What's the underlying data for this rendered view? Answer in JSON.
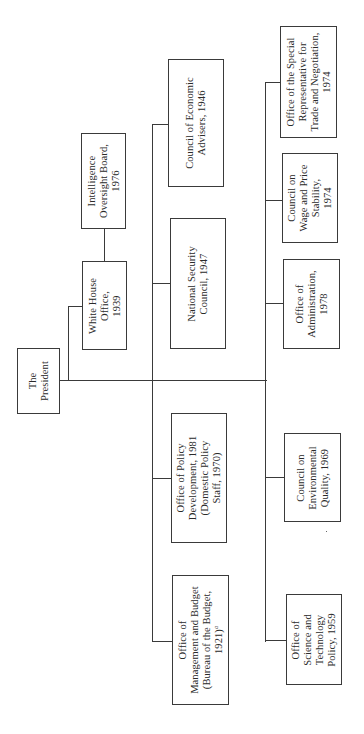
{
  "chart": {
    "root": {
      "id": "president",
      "lines": [
        "The",
        "President"
      ]
    },
    "offices": [
      {
        "id": "white-house-office",
        "lines": [
          "White House",
          "Office,",
          "1939"
        ]
      },
      {
        "id": "intelligence-oversight-board",
        "lines": [
          "Intelligence",
          "Oversight Board,",
          "1976"
        ]
      },
      {
        "id": "council-of-economic-advisers",
        "lines": [
          "Council of Economic",
          "Advisers, 1946"
        ]
      },
      {
        "id": "national-security-council",
        "lines": [
          "National Security",
          "Council, 1947"
        ]
      },
      {
        "id": "office-of-policy-development",
        "lines": [
          "Office of Policy",
          "Development, 1981",
          "(Domestic Policy",
          "Staff, 1970)"
        ]
      },
      {
        "id": "office-of-management-and-budget",
        "lines": [
          "Office of",
          "Management and Budget",
          "(Bureau of the Budget,",
          "1921)"
        ],
        "footnote": "a"
      },
      {
        "id": "office-of-special-representative",
        "lines": [
          "Office of the Special",
          "Representative for",
          "Trade and Negotiation,",
          "1974"
        ]
      },
      {
        "id": "council-on-wage-and-price-stability",
        "lines": [
          "Council on",
          "Wage and Price",
          "Stability,",
          "1974"
        ]
      },
      {
        "id": "office-of-administration",
        "lines": [
          "Office of",
          "Administration,",
          "1978"
        ]
      },
      {
        "id": "council-on-environmental-quality",
        "lines": [
          "Council on",
          "Environmental",
          "Quality, 1969"
        ]
      },
      {
        "id": "office-of-science-and-technology-policy",
        "lines": [
          "Office of",
          "Science and",
          "Technology",
          "Policy, 1959"
        ]
      }
    ]
  }
}
